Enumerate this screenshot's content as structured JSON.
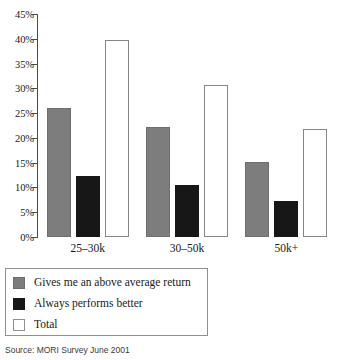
{
  "chart_data": {
    "type": "bar",
    "title": "",
    "subtitle": "",
    "xlabel": "",
    "ylabel": "",
    "categories": [
      "25–30k",
      "30–50k",
      "50k+"
    ],
    "series": [
      {
        "name": "Gives me an above average return",
        "color": "#7d7d7d",
        "values": [
          26.0,
          22.2,
          15.2
        ]
      },
      {
        "name": "Always performs better",
        "color": "#171717",
        "values": [
          12.4,
          10.4,
          7.2
        ]
      },
      {
        "name": "Total",
        "color": "#ffffff",
        "values": [
          39.8,
          30.7,
          21.8
        ]
      }
    ],
    "ylim": [
      0,
      45
    ],
    "ytick_values": [
      0,
      5,
      10,
      15,
      20,
      25,
      30,
      35,
      40,
      45
    ],
    "ytick_labels": [
      "0%",
      "5%",
      "10%",
      "15%",
      "20%",
      "25%",
      "30%",
      "35%",
      "40%",
      "45%"
    ],
    "grid": false,
    "legend_position": "below-plot"
  },
  "legend": {
    "items": [
      {
        "label": "Gives me an above average return",
        "swatch": "gray"
      },
      {
        "label": "Always performs better",
        "swatch": "black"
      },
      {
        "label": "Total",
        "swatch": "white"
      }
    ]
  },
  "footer": {
    "source": "Source: MORI Survey June 2001"
  }
}
